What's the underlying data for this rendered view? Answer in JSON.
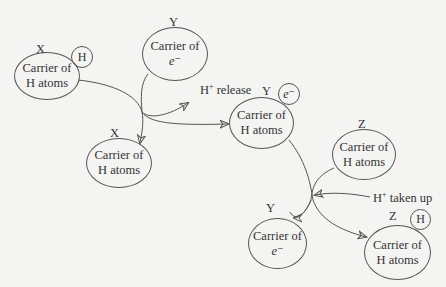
{
  "diagram": {
    "nodes": [
      {
        "id": "x1",
        "letter": "X",
        "line1": "Carrier of",
        "line2": "H atoms",
        "badge": "H"
      },
      {
        "id": "y1",
        "letter": "Y",
        "line1": "Carrier of",
        "line2": "e⁻",
        "badge": ""
      },
      {
        "id": "x2",
        "letter": "X",
        "line1": "Carrier of",
        "line2": "H atoms",
        "badge": ""
      },
      {
        "id": "y2",
        "letter": "Y",
        "line1": "Carrier of",
        "line2": "H atoms",
        "badge": "e⁻"
      },
      {
        "id": "z1",
        "letter": "Z",
        "line1": "Carrier of",
        "line2": "H atoms",
        "badge": ""
      },
      {
        "id": "y3",
        "letter": "Y",
        "line1": "Carrier of",
        "line2": "e⁻",
        "badge": ""
      },
      {
        "id": "z2",
        "letter": "Z",
        "line1": "Carrier of",
        "line2": "H atoms",
        "badge": "H"
      }
    ],
    "annotations": {
      "h_release": {
        "prefix": "H",
        "sup": "+",
        "text": " release"
      },
      "h_taken_up": {
        "prefix": "H",
        "sup": "+",
        "text": " taken up"
      }
    },
    "edges": [
      {
        "from": "x1",
        "to": "x2"
      },
      {
        "from": "y1",
        "to": "y2"
      },
      {
        "from": "junction1",
        "to": "h_release"
      },
      {
        "from": "y2",
        "to": "z2"
      },
      {
        "from": "z1",
        "to": "y3"
      },
      {
        "from": "h_taken_up",
        "to": "junction2"
      }
    ]
  }
}
